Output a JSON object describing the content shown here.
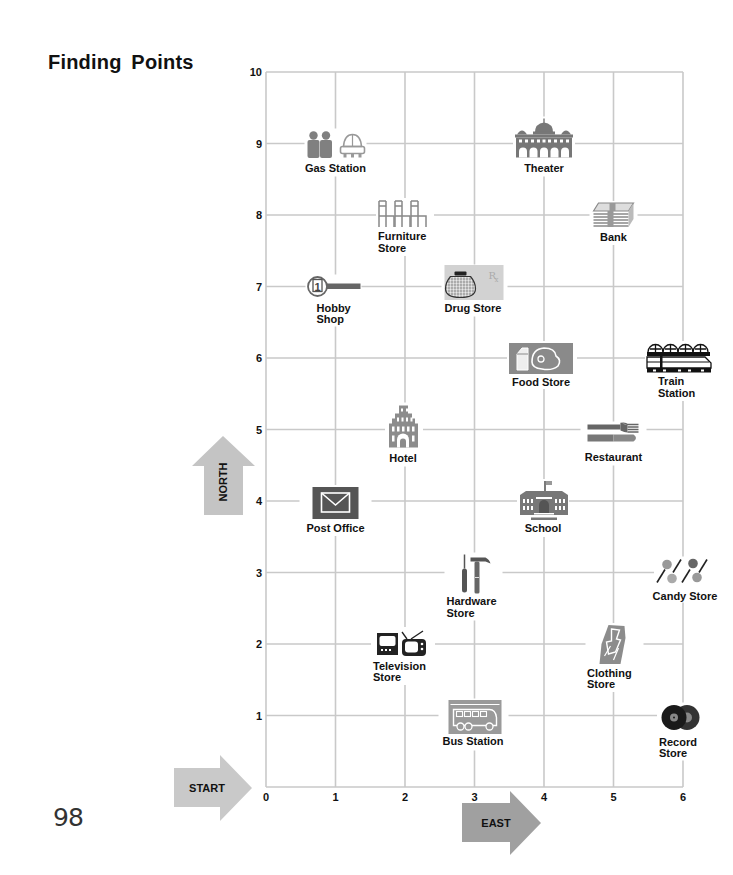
{
  "page": {
    "title": "Finding Points",
    "page_number": "98"
  },
  "arrows": {
    "north": "NORTH",
    "start": "START",
    "east": "EAST"
  },
  "colors": {
    "grid": "#c9c9c9",
    "north_arrow": "#c4c4c4",
    "start_arrow": "#c9c9c9",
    "east_arrow": "#a0a0a0",
    "icon_gray": "#8a8a8a",
    "icon_dark": "#555555"
  },
  "chart_data": {
    "type": "scatter",
    "title": "Finding Points",
    "xlabel": "EAST",
    "ylabel": "NORTH",
    "origin_label": "START",
    "xlim": [
      0,
      6
    ],
    "ylim": [
      0,
      10
    ],
    "grid": true,
    "x_ticks": [
      "0",
      "1",
      "2",
      "3",
      "4",
      "5",
      "6"
    ],
    "y_ticks": [
      "1",
      "2",
      "3",
      "4",
      "5",
      "6",
      "7",
      "8",
      "9",
      "10"
    ],
    "points": [
      {
        "name": "Gas Station",
        "x": 1,
        "y": 9,
        "label": [
          "Gas Station"
        ],
        "icon": "gas-station-icon"
      },
      {
        "name": "Theater",
        "x": 4,
        "y": 9,
        "label": [
          "Theater"
        ],
        "icon": "theater-icon"
      },
      {
        "name": "Furniture Store",
        "x": 2,
        "y": 8,
        "label": [
          "Furniture",
          "Store"
        ],
        "icon": "chairs-icon"
      },
      {
        "name": "Bank",
        "x": 5,
        "y": 8,
        "label": [
          "Bank"
        ],
        "icon": "money-stack-icon"
      },
      {
        "name": "Hobby Shop",
        "x": 1,
        "y": 7,
        "label": [
          "Hobby",
          "Shop"
        ],
        "icon": "hobby-magnifier-icon"
      },
      {
        "name": "Drug Store",
        "x": 3,
        "y": 7,
        "label": [
          "Drug Store"
        ],
        "icon": "pharmacy-jar-icon"
      },
      {
        "name": "Food Store",
        "x": 4,
        "y": 6,
        "label": [
          "Food Store"
        ],
        "icon": "groceries-icon"
      },
      {
        "name": "Train Station",
        "x": 6,
        "y": 6,
        "label": [
          "Train",
          "Station"
        ],
        "icon": "train-icon"
      },
      {
        "name": "Hotel",
        "x": 2,
        "y": 5,
        "label": [
          "Hotel"
        ],
        "icon": "hotel-building-icon"
      },
      {
        "name": "Restaurant",
        "x": 5,
        "y": 5,
        "label": [
          "Restaurant"
        ],
        "icon": "fork-knife-icon"
      },
      {
        "name": "Post Office",
        "x": 1,
        "y": 4,
        "label": [
          "Post Office"
        ],
        "icon": "envelope-icon"
      },
      {
        "name": "School",
        "x": 4,
        "y": 4,
        "label": [
          "School"
        ],
        "icon": "school-building-icon"
      },
      {
        "name": "Hardware Store",
        "x": 3,
        "y": 3,
        "label": [
          "Hardware",
          "Store"
        ],
        "icon": "hammer-screwdriver-icon"
      },
      {
        "name": "Candy Store",
        "x": 6,
        "y": 3,
        "label": [
          "Candy Store"
        ],
        "icon": "lollipops-icon"
      },
      {
        "name": "Television Store",
        "x": 2,
        "y": 2,
        "label": [
          "Television",
          "Store"
        ],
        "icon": "television-icon"
      },
      {
        "name": "Clothing Store",
        "x": 5,
        "y": 2,
        "label": [
          "Clothing",
          "Store"
        ],
        "icon": "clothing-icon"
      },
      {
        "name": "Bus Station",
        "x": 3,
        "y": 1,
        "label": [
          "Bus Station"
        ],
        "icon": "bus-icon"
      },
      {
        "name": "Record Store",
        "x": 6,
        "y": 1,
        "label": [
          "Record",
          "Store"
        ],
        "icon": "records-icon"
      }
    ]
  }
}
